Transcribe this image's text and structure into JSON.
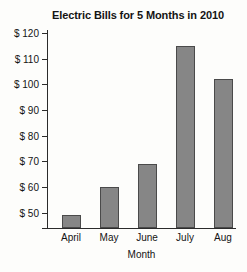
{
  "chart_data": {
    "type": "bar",
    "title": "Electric Bills for 5 Months in 2010",
    "xlabel": "Month",
    "ylabel": "",
    "categories": [
      "April",
      "May",
      "June",
      "July",
      "Aug"
    ],
    "values": [
      49,
      60,
      69,
      115,
      102
    ],
    "ylim": [
      44,
      122
    ],
    "ytick_values": [
      50,
      60,
      70,
      80,
      90,
      100,
      110,
      120
    ],
    "ytick_labels": [
      "$ 50",
      "$ 60",
      "$ 70",
      "$ 80",
      "$ 90",
      "$ 100",
      "$ 110",
      "$ 120"
    ],
    "grid": false,
    "legend": null,
    "colors": {
      "bar_fill": "#868686",
      "bar_stroke": "#4a4a4a",
      "axis": "#2b2b2b",
      "text": "#141414",
      "background": "#fdfdfb"
    }
  }
}
